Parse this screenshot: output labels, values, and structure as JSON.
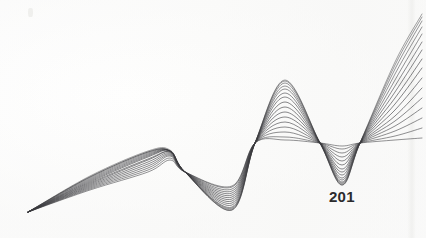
{
  "page": {
    "number": "201",
    "width": 426,
    "height": 238,
    "background_color": "#fefefe",
    "paper_tint": "#fbfbfa"
  },
  "figure": {
    "title": "",
    "caption": "",
    "kind": "generative-line-art",
    "stroke_color": "#3a3a3e",
    "stroke_color_light": "#9a9aa0",
    "stroke_width": 0.55,
    "strand_count": 16
  },
  "chart_data": {
    "type": "line",
    "title": "",
    "subtitle": "",
    "xlabel": "",
    "ylabel": "",
    "xlim": [
      0,
      426
    ],
    "ylim": [
      238,
      0
    ],
    "grid": false,
    "legend": null,
    "annotations": [
      {
        "text": "201",
        "x": 342,
        "y": 197,
        "role": "page-number"
      }
    ],
    "nodes": [
      {
        "name": "left-tail-tip",
        "x": 28,
        "y": 212
      },
      {
        "name": "node-1",
        "x": 170,
        "y": 172
      },
      {
        "name": "node-2",
        "x": 255,
        "y": 143
      },
      {
        "name": "node-3",
        "x": 342,
        "y": 143
      }
    ],
    "extrema": [
      {
        "name": "hump-1-peak",
        "x": 148,
        "y": 152
      },
      {
        "name": "trough-1",
        "x": 232,
        "y": 210
      },
      {
        "name": "peak-main",
        "x": 285,
        "y": 80
      },
      {
        "name": "fan-top-right",
        "x": 420,
        "y": 15
      },
      {
        "name": "fan-bottom-right",
        "x": 420,
        "y": 185
      }
    ],
    "series": [
      {
        "name": "strand-01",
        "amplitude": 0.0,
        "values": [
          212,
          190,
          172,
          160,
          172,
          186,
          143,
          140,
          143,
          146,
          143,
          140,
          138
        ]
      },
      {
        "name": "strand-02",
        "amplitude": 0.07,
        "values": [
          212,
          189,
          170,
          158,
          172,
          187,
          143,
          137,
          143,
          149,
          143,
          136,
          128
        ]
      },
      {
        "name": "strand-03",
        "amplitude": 0.14,
        "values": [
          212,
          188,
          168,
          156,
          172,
          189,
          143,
          132,
          143,
          153,
          143,
          131,
          118
        ]
      },
      {
        "name": "strand-04",
        "amplitude": 0.21,
        "values": [
          212,
          187,
          166,
          155,
          172,
          191,
          143,
          127,
          143,
          157,
          143,
          126,
          108
        ]
      },
      {
        "name": "strand-05",
        "amplitude": 0.28,
        "values": [
          212,
          186,
          164,
          154,
          172,
          193,
          143,
          122,
          143,
          161,
          143,
          121,
          98
        ]
      },
      {
        "name": "strand-06",
        "amplitude": 0.35,
        "values": [
          212,
          185,
          162,
          153,
          172,
          195,
          143,
          117,
          143,
          165,
          143,
          116,
          88
        ]
      },
      {
        "name": "strand-07",
        "amplitude": 0.42,
        "values": [
          212,
          184,
          160,
          152,
          172,
          197,
          143,
          112,
          143,
          169,
          143,
          110,
          78
        ]
      },
      {
        "name": "strand-08",
        "amplitude": 0.49,
        "values": [
          212,
          183,
          159,
          152,
          172,
          199,
          143,
          107,
          143,
          172,
          143,
          104,
          68
        ]
      },
      {
        "name": "strand-09",
        "amplitude": 0.56,
        "values": [
          212,
          182,
          157,
          151,
          172,
          201,
          143,
          102,
          143,
          175,
          143,
          98,
          59
        ]
      },
      {
        "name": "strand-10",
        "amplitude": 0.63,
        "values": [
          212,
          181,
          156,
          151,
          172,
          203,
          143,
          97,
          143,
          178,
          143,
          92,
          50
        ]
      },
      {
        "name": "strand-11",
        "amplitude": 0.7,
        "values": [
          212,
          180,
          155,
          151,
          172,
          205,
          143,
          93,
          143,
          180,
          143,
          86,
          42
        ]
      },
      {
        "name": "strand-12",
        "amplitude": 0.77,
        "values": [
          212,
          179,
          154,
          151,
          172,
          207,
          143,
          89,
          143,
          182,
          143,
          80,
          34
        ]
      },
      {
        "name": "strand-13",
        "amplitude": 0.84,
        "values": [
          212,
          178,
          153,
          151,
          172,
          208,
          143,
          86,
          143,
          183,
          143,
          74,
          27
        ]
      },
      {
        "name": "strand-14",
        "amplitude": 0.9,
        "values": [
          212,
          177,
          152,
          151,
          172,
          209,
          143,
          83,
          143,
          184,
          143,
          69,
          21
        ]
      },
      {
        "name": "strand-15",
        "amplitude": 0.95,
        "values": [
          212,
          177,
          152,
          151,
          172,
          210,
          143,
          81,
          143,
          185,
          143,
          65,
          17
        ]
      },
      {
        "name": "strand-16",
        "amplitude": 1.0,
        "values": [
          212,
          176,
          151,
          150,
          172,
          210,
          143,
          80,
          143,
          185,
          143,
          62,
          14
        ]
      }
    ],
    "x": [
      28,
      90,
      148,
      170,
      185,
      232,
      255,
      285,
      320,
      342,
      360,
      395,
      422
    ]
  }
}
